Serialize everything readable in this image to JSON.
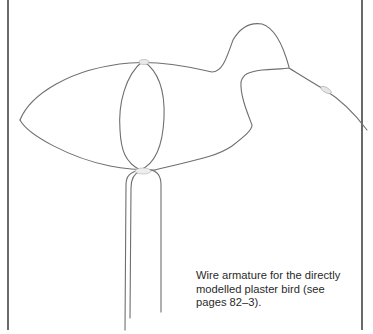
{
  "figure": {
    "caption": "Wire armature for the directly modelled plaster bird (see pages 82–3).",
    "colors": {
      "wire": "#6f6f6f",
      "border": "#6a6a6a",
      "tape": "#e6e6e6",
      "text": "#2a2a2a"
    }
  }
}
